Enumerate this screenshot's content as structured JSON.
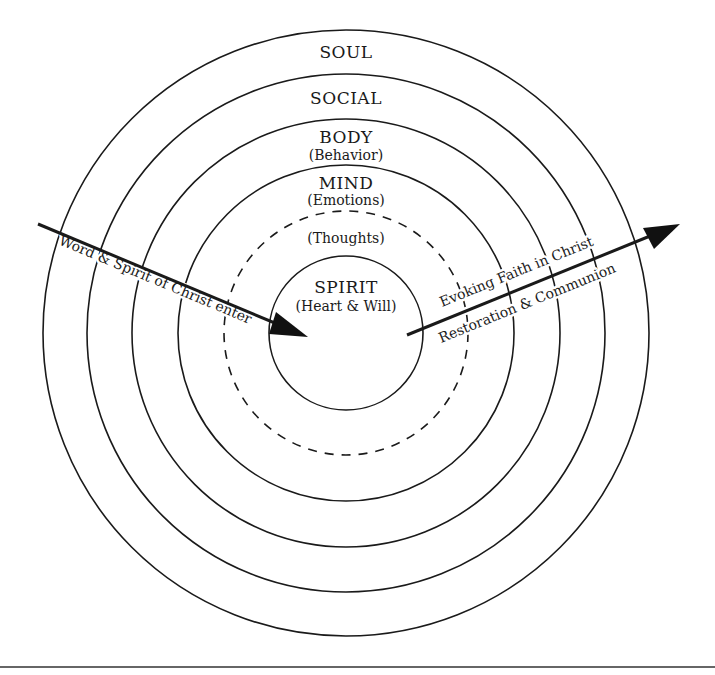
{
  "diagram": {
    "center": {
      "x": 346,
      "y": 333
    },
    "rings": [
      {
        "name": "soul",
        "r": 303,
        "style": "solid"
      },
      {
        "name": "social",
        "r": 259,
        "style": "solid"
      },
      {
        "name": "body",
        "r": 214,
        "style": "solid"
      },
      {
        "name": "mind",
        "r": 168,
        "style": "solid"
      },
      {
        "name": "thoughts",
        "r": 122,
        "style": "dashed"
      },
      {
        "name": "spirit",
        "r": 77,
        "style": "solid"
      }
    ],
    "labels": {
      "soul": "SOUL",
      "social": "SOCIAL",
      "body": "BODY",
      "body_sub": "(Behavior)",
      "mind": "MIND",
      "mind_sub": "(Emotions)",
      "thoughts": "(Thoughts)",
      "spirit": "SPIRIT",
      "spirit_sub": "(Heart & Will)"
    },
    "arrows": {
      "inward": {
        "label": "Word & Spirit of Christ enter"
      },
      "outward": {
        "label_above": "Evoking Faith in Christ",
        "label_below": "Restoration & Communion"
      }
    }
  }
}
